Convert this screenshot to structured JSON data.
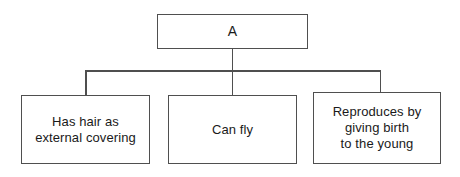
{
  "diagram": {
    "type": "tree",
    "title": "",
    "orientation": "top-down",
    "background_color": "#ffffff",
    "line_color": "#4f4f4f",
    "text_color": "#1a1a1a",
    "root": {
      "id": "A",
      "label": "A"
    },
    "children": [
      {
        "id": "leaf-0",
        "label": "Has hair as\nexternal covering",
        "lines": [
          "Has hair as",
          "external covering"
        ]
      },
      {
        "id": "leaf-1",
        "label": "Can fly",
        "lines": [
          "Can fly"
        ]
      },
      {
        "id": "leaf-2",
        "label": "Reproduces by\ngiving birth\nto the young",
        "lines": [
          "Reproduces by",
          "giving birth",
          "to the young"
        ]
      }
    ],
    "edges": [
      {
        "from": "A",
        "to": "leaf-0"
      },
      {
        "from": "A",
        "to": "leaf-1"
      },
      {
        "from": "A",
        "to": "leaf-2"
      }
    ]
  }
}
